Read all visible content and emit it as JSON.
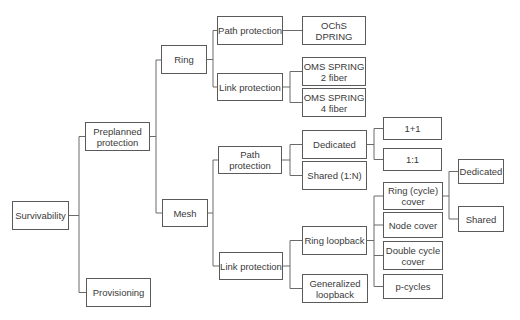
{
  "diagram": {
    "type": "taxonomy-tree",
    "root": "Survivability",
    "nodes": {
      "survivability": "Survivability",
      "preplanned": "Preplanned\nprotection",
      "provisioning": "Provisioning",
      "ring": "Ring",
      "mesh": "Mesh",
      "ring_path": "Path protection",
      "ring_link": "Link protection",
      "ochs_dpring": "OChS DPRING",
      "oms_spring_2": "OMS SPRING\n2 fiber",
      "oms_spring_4": "OMS SPRING\n4 fiber",
      "mesh_path": "Path protection",
      "mesh_link": "Link protection",
      "dedicated": "Dedicated",
      "shared_1n": "Shared (1:N)",
      "one_plus_one": "1+1",
      "one_to_one": "1:1",
      "ring_loopback": "Ring loopback",
      "generalized_loopback": "Generalized\nloopback",
      "ring_cycle_cover": "Ring (cycle)\ncover",
      "node_cover": "Node cover",
      "double_cycle_cover": "Double cycle\ncover",
      "p_cycles": "p-cycles",
      "cover_dedicated": "Dedicated",
      "cover_shared": "Shared"
    },
    "edges": [
      [
        "Survivability",
        "Preplanned protection"
      ],
      [
        "Survivability",
        "Provisioning"
      ],
      [
        "Preplanned protection",
        "Ring"
      ],
      [
        "Preplanned protection",
        "Mesh"
      ],
      [
        "Ring",
        "Path protection"
      ],
      [
        "Ring",
        "Link protection"
      ],
      [
        "Path protection (Ring)",
        "OChS DPRING"
      ],
      [
        "Link protection (Ring)",
        "OMS SPRING 2 fiber"
      ],
      [
        "Link protection (Ring)",
        "OMS SPRING 4 fiber"
      ],
      [
        "Mesh",
        "Path protection"
      ],
      [
        "Mesh",
        "Link protection"
      ],
      [
        "Path protection (Mesh)",
        "Dedicated"
      ],
      [
        "Path protection (Mesh)",
        "Shared (1:N)"
      ],
      [
        "Dedicated",
        "1+1"
      ],
      [
        "Dedicated",
        "1:1"
      ],
      [
        "Link protection (Mesh)",
        "Ring loopback"
      ],
      [
        "Link protection (Mesh)",
        "Generalized loopback"
      ],
      [
        "Ring loopback",
        "Ring (cycle) cover"
      ],
      [
        "Ring loopback",
        "Node cover"
      ],
      [
        "Ring loopback",
        "Double cycle cover"
      ],
      [
        "Ring loopback",
        "p-cycles"
      ],
      [
        "Ring (cycle) cover",
        "Dedicated"
      ],
      [
        "Ring (cycle) cover",
        "Shared"
      ]
    ]
  }
}
